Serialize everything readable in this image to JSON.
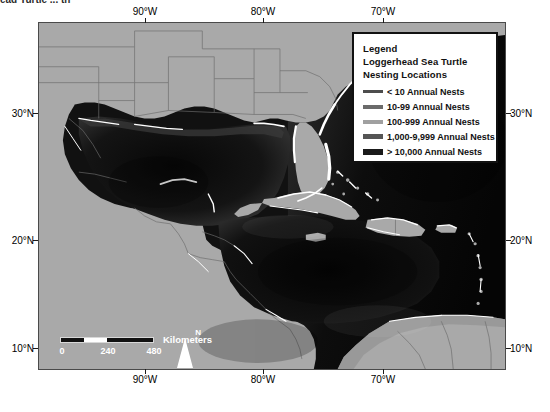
{
  "caption_fragment": "ead Turtle ... th",
  "map": {
    "title": "Loggerhead Sea Turtle Nesting Locations",
    "projection_note": "",
    "axes": {
      "longitude_labels": [
        "90°W",
        "80°W",
        "70°W"
      ],
      "longitude_x": [
        145,
        263,
        383
      ],
      "latitude_labels": [
        "30°N",
        "20°N",
        "10°N"
      ],
      "latitude_y": [
        113,
        240,
        348
      ]
    },
    "colors": {
      "land": "#a9a9a9",
      "ocean_shelf": "#4a4a4a",
      "ocean_deep": "#0a0a0a",
      "ocean_mid": "#262626",
      "border_line": "#6e6e6e",
      "nesting_line": "#ffffff",
      "frame": "#4a4a4a"
    }
  },
  "legend": {
    "heading": "Legend",
    "subtitle_line1": "Loggerhead Sea Turtle",
    "subtitle_line2": "Nesting Locations",
    "items": [
      {
        "label": "< 10 Annual Nests",
        "color": "#4d4d4d",
        "thickness": 3
      },
      {
        "label": "10-99 Annual Nests",
        "color": "#6b6b6b",
        "thickness": 4
      },
      {
        "label": "100-999 Annual Nests",
        "color": "#a0a0a0",
        "thickness": 4
      },
      {
        "label": "1,000-9,999 Annual Nests",
        "color": "#555555",
        "thickness": 5
      },
      {
        "label": "> 10,000 Annual Nests",
        "color": "#1a1a1a",
        "thickness": 6
      }
    ]
  },
  "scale_bar": {
    "units_label": "Kilometers",
    "ticks": [
      "0",
      "240",
      "480"
    ],
    "tick_x": [
      0,
      46,
      92
    ]
  },
  "north_arrow": {
    "label": "N"
  }
}
